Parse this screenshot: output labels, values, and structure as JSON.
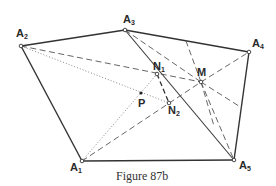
{
  "figure": {
    "caption": "Figure 87b",
    "vertices": {
      "A1": {
        "label": "A",
        "sub": "1",
        "x": 82,
        "y": 161
      },
      "A2": {
        "label": "A",
        "sub": "2",
        "x": 21,
        "y": 46
      },
      "A3": {
        "label": "A",
        "sub": "3",
        "x": 125,
        "y": 30
      },
      "A4": {
        "label": "A",
        "sub": "4",
        "x": 249,
        "y": 52
      },
      "A5": {
        "label": "A",
        "sub": "5",
        "x": 234,
        "y": 160
      }
    },
    "points": {
      "M": {
        "label": "M",
        "x": 201,
        "y": 82
      },
      "N1": {
        "label": "N",
        "sub": "1",
        "x": 157,
        "y": 74
      },
      "N2": {
        "label": "N",
        "sub": "2",
        "x": 169,
        "y": 103
      },
      "P": {
        "label": "P",
        "x": 141,
        "y": 93
      }
    },
    "colors": {
      "stroke": "#333333",
      "dotted": "#888888",
      "background": "#ffffff"
    }
  }
}
